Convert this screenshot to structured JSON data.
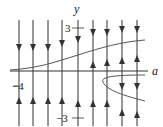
{
  "diagram": {
    "type": "phase-line bifurcation diagram",
    "axes": {
      "horizontal_label": "a",
      "vertical_label": "y",
      "ticks": {
        "y_top": "3",
        "y_bottom": "−3",
        "a_left": "−4"
      }
    },
    "phase_lines": [
      {
        "x": 19,
        "arrows": [
          {
            "y": 48,
            "dir": "down"
          },
          {
            "y": 100,
            "dir": "up"
          }
        ]
      },
      {
        "x": 33,
        "arrows": [
          {
            "y": 48,
            "dir": "down"
          },
          {
            "y": 100,
            "dir": "up"
          }
        ]
      },
      {
        "x": 48,
        "arrows": [
          {
            "y": 48,
            "dir": "down"
          },
          {
            "y": 100,
            "dir": "up"
          }
        ]
      },
      {
        "x": 62,
        "arrows": [
          {
            "y": 44,
            "dir": "down"
          },
          {
            "y": 100,
            "dir": "up"
          }
        ]
      },
      {
        "x": 78,
        "arrows": [
          {
            "y": 40,
            "dir": "down"
          },
          {
            "y": 103,
            "dir": "up"
          }
        ]
      },
      {
        "x": 93,
        "arrows": [
          {
            "y": 33,
            "dir": "down"
          },
          {
            "y": 64,
            "dir": "up"
          },
          {
            "y": 103,
            "dir": "up"
          }
        ]
      },
      {
        "x": 107,
        "arrows": [
          {
            "y": 33,
            "dir": "down"
          },
          {
            "y": 62,
            "dir": "up"
          },
          {
            "y": 103,
            "dir": "up"
          }
        ]
      },
      {
        "x": 122,
        "arrows": [
          {
            "y": 30,
            "dir": "down"
          },
          {
            "y": 60,
            "dir": "up"
          },
          {
            "y": 87,
            "dir": "down"
          },
          {
            "y": 112,
            "dir": "up"
          }
        ]
      },
      {
        "x": 137,
        "arrows": [
          {
            "y": 30,
            "dir": "down"
          },
          {
            "y": 58,
            "dir": "up"
          },
          {
            "y": 87,
            "dir": "down"
          },
          {
            "y": 114,
            "dir": "up"
          }
        ]
      }
    ],
    "curves": [
      {
        "name": "s-shaped equilibrium curve",
        "path": "M10,70 C40,68 55,62 78,55 C100,48 120,42 145,40"
      },
      {
        "name": "left-opening parabola equilibrium curve",
        "path": "M145,75 C120,75 100,76 103,82 C106,90 125,96 145,101"
      }
    ],
    "colors": {
      "line": "#333333",
      "curve": "#555555",
      "background": "#ffffff"
    }
  }
}
